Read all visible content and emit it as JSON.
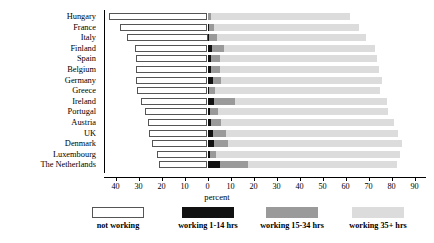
{
  "chart_data": {
    "type": "bar",
    "subtype": "stacked-horizontal-diverging",
    "title": "",
    "xlabel": "percent",
    "ylabel": "",
    "xlim": [
      -45,
      95
    ],
    "xticks": [
      -40,
      -30,
      -20,
      -10,
      0,
      10,
      20,
      30,
      40,
      50,
      60,
      70,
      80,
      90
    ],
    "xticklabels": [
      "40",
      "30",
      "20",
      "10",
      "0",
      "10",
      "20",
      "30",
      "40",
      "50",
      "60",
      "70",
      "80",
      "90"
    ],
    "grid": false,
    "legend_position": "bottom",
    "categories": [
      "Hungary",
      "France",
      "Italy",
      "Finland",
      "Spain",
      "Belgium",
      "Germany",
      "Greece",
      "Ireland",
      "Portugal",
      "Austria",
      "UK",
      "Denmark",
      "Luxembourg",
      "The Netherlands"
    ],
    "series": [
      {
        "name": "not working",
        "color": "#ffffff",
        "direction": "left",
        "values": [
          43.0,
          38.0,
          35.0,
          31.5,
          31.0,
          31.0,
          31.0,
          30.5,
          29.0,
          27.0,
          26.0,
          25.5,
          24.0,
          22.0,
          21.0
        ]
      },
      {
        "name": "working 1-14 hrs",
        "color": "#111111",
        "direction": "right",
        "values": [
          0.4,
          0.6,
          0.8,
          2.0,
          1.5,
          1.4,
          2.2,
          0.8,
          3.0,
          1.2,
          1.5,
          2.6,
          3.0,
          1.0,
          5.5
        ]
      },
      {
        "name": "working 15-34 hrs",
        "color": "#9a9a9a",
        "direction": "right",
        "values": [
          1.0,
          2.4,
          3.2,
          5.0,
          4.0,
          4.0,
          3.6,
          2.4,
          9.0,
          3.2,
          4.5,
          5.4,
          6.0,
          2.6,
          12.0
        ]
      },
      {
        "name": "working 35+ hrs",
        "color": "#dcdcdc",
        "direction": "right",
        "values": [
          60.5,
          63.0,
          65.0,
          66.0,
          68.0,
          69.0,
          70.0,
          72.0,
          66.0,
          74.0,
          75.0,
          75.0,
          75.5,
          80.0,
          65.0
        ]
      }
    ]
  },
  "legend": {
    "items": [
      {
        "label": "not working",
        "swatch_class": "sw-notworking",
        "name": "legend-swatch-not-working",
        "x": 118
      },
      {
        "label": "working 1-14 hrs",
        "swatch_class": "sw-1-14",
        "name": "legend-swatch-1-14-hrs",
        "x": 208
      },
      {
        "label": "working 15-34 hrs",
        "swatch_class": "sw-15-34",
        "name": "legend-swatch-15-34-hrs",
        "x": 292
      },
      {
        "label": "working 35+ hrs",
        "swatch_class": "sw-35plus",
        "name": "legend-swatch-35-plus-hrs",
        "x": 378
      }
    ]
  },
  "colors": {
    "not_working": "#ffffff",
    "working_1_14": "#111111",
    "working_15_34": "#9a9a9a",
    "working_35_plus": "#dcdcdc",
    "axis": "#000000",
    "background": "#ffffff"
  }
}
